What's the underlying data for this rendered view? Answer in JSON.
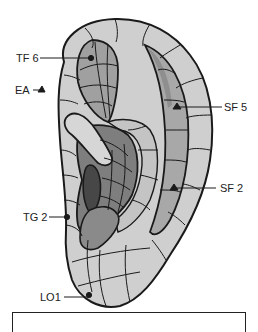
{
  "figure": {
    "colors": {
      "outline": "#1a1a1a",
      "light": "#cfcfcf",
      "medium": "#a8a8a8",
      "dark": "#7e7e7e",
      "darkest": "#474747",
      "background": "#ffffff"
    },
    "labels": [
      {
        "id": "TF6",
        "text": "TF 6",
        "marker": "dot"
      },
      {
        "id": "EA",
        "text": "EA",
        "marker": "triangle"
      },
      {
        "id": "SF5",
        "text": "SF 5",
        "marker": "triangle"
      },
      {
        "id": "SF2",
        "text": "SF 2",
        "marker": "triangle"
      },
      {
        "id": "TG2",
        "text": "TG 2",
        "marker": "dot"
      },
      {
        "id": "LO1",
        "text": "LO1",
        "marker": "dot"
      }
    ]
  },
  "caption": {
    "text": ""
  }
}
